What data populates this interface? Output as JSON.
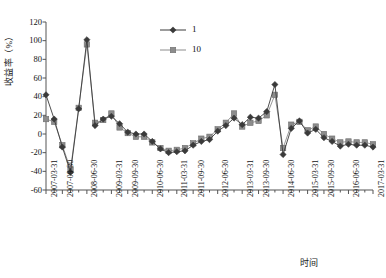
{
  "chart_data": {
    "type": "line",
    "title": "",
    "xlabel": "时间",
    "ylabel": "收益率（%）",
    "ylim": [
      -60,
      120
    ],
    "yticks": [
      -60,
      -40,
      -20,
      0,
      20,
      40,
      60,
      80,
      100,
      120
    ],
    "ytick_labels": [
      "-60",
      "-40",
      "-20",
      "0",
      "20",
      "40",
      "60",
      "80",
      "100",
      "120"
    ],
    "grid": false,
    "legend_position": "top-right",
    "legend": [
      "1",
      "10"
    ],
    "x": [
      "2007-03-31",
      "2007-06-30",
      "2007-09-30",
      "2007-12-31",
      "2008-03-31",
      "2008-06-30",
      "2008-09-30",
      "2008-12-31",
      "2009-03-31",
      "2009-06-30",
      "2009-09-30",
      "2009-12-31",
      "2010-03-31",
      "2010-06-30",
      "2010-09-30",
      "2010-12-31",
      "2011-03-31",
      "2011-06-30",
      "2011-09-30",
      "2011-12-31",
      "2012-03-31",
      "2012-06-30",
      "2012-09-30",
      "2012-12-31",
      "2013-03-31",
      "2013-06-30",
      "2013-09-30",
      "2013-12-31",
      "2014-03-31",
      "2014-06-30",
      "2014-09-30",
      "2014-12-31",
      "2015-03-31",
      "2015-06-30",
      "2015-09-30",
      "2015-12-31",
      "2016-03-31",
      "2016-06-30",
      "2016-09-30",
      "2016-12-31",
      "2017-03-31"
    ],
    "xtick_labels": [
      "2007-03-31",
      "2007-09-30",
      "2008-06-30",
      "2009-03-31",
      "2009-09-30",
      "2010-06-30",
      "2011-03-31",
      "2011-09-30",
      "2012-06-30",
      "2013-03-31",
      "2013-09-30",
      "2014-06-30",
      "2015-03-31",
      "2015-09-30",
      "2016-06-30",
      "2017-03-31"
    ],
    "xtick_index": [
      0,
      2,
      5,
      8,
      10,
      13,
      16,
      18,
      21,
      24,
      26,
      29,
      32,
      34,
      37,
      40
    ],
    "series": [
      {
        "name": "1",
        "marker": "diamond",
        "color": "#3a3a3a",
        "values": [
          42,
          16,
          -14,
          -41,
          27,
          101,
          9,
          16,
          19,
          11,
          2,
          0,
          0,
          -8,
          -16,
          -20,
          -19,
          -18,
          -12,
          -8,
          -6,
          3,
          9,
          17,
          10,
          18,
          17,
          24,
          53,
          -22,
          6,
          14,
          1,
          5,
          -4,
          -8,
          -13,
          -11,
          -12,
          -12,
          -14
        ]
      },
      {
        "name": "10",
        "marker": "square",
        "color": "#8c8c8c",
        "values": [
          16,
          13,
          -12,
          -38,
          28,
          96,
          12,
          15,
          22,
          7,
          1,
          -3,
          -3,
          -9,
          -15,
          -18,
          -17,
          -15,
          -10,
          -5,
          -3,
          5,
          12,
          22,
          8,
          12,
          14,
          20,
          42,
          -15,
          10,
          13,
          4,
          8,
          0,
          -5,
          -9,
          -8,
          -9,
          -9,
          -11
        ]
      }
    ]
  }
}
